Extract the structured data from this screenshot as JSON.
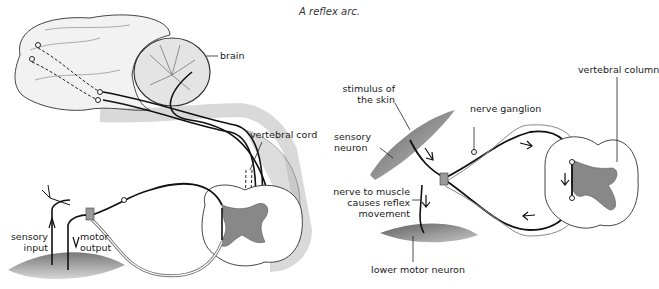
{
  "caption": "A reflex arc.",
  "left_diagram": {
    "labels": {
      "brain": "brain",
      "vertebral_cord": "vertebral cord",
      "sensory_input": [
        "sensory",
        "input"
      ],
      "motor_output": [
        "motor",
        "output"
      ]
    }
  },
  "right_diagram": {
    "labels": {
      "stimulus": [
        "stimulus of",
        "the skin"
      ],
      "sensory_neuron": [
        "sensory",
        "neuron"
      ],
      "nerve_ganglion": "nerve ganglion",
      "vertebral_column": "vertebral column",
      "nerve_to_muscle": [
        "nerve to muscle",
        "causes reflex",
        "movement"
      ],
      "lower_motor_neuron": "lower motor neuron"
    }
  }
}
